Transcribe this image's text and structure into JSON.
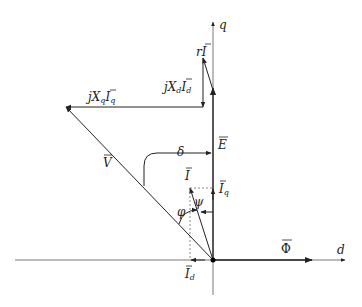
{
  "diagram": {
    "axes": {
      "q_label": "q",
      "d_label": "d"
    },
    "vectors": {
      "phi": {
        "label": "Φ"
      },
      "E": {
        "label": "E"
      },
      "rI": {
        "label_main": "rI"
      },
      "jXdId": {
        "label_j": "jX",
        "sub_d": "d",
        "I": "I",
        "sub_d2": "d"
      },
      "jXqIq": {
        "label_j": "jX",
        "sub_q": "q",
        "I": "I",
        "sub_q2": "q"
      },
      "V": {
        "label": "V"
      },
      "I": {
        "label": "I"
      },
      "Iq": {
        "label": "I",
        "sub": "q"
      },
      "Id": {
        "label": "I",
        "sub": "d"
      }
    },
    "angles": {
      "delta": "δ",
      "psi": "ψ",
      "phi": "φ"
    },
    "colors": {
      "line": "#222222",
      "dotted": "#555555",
      "background": "#ffffff"
    }
  }
}
